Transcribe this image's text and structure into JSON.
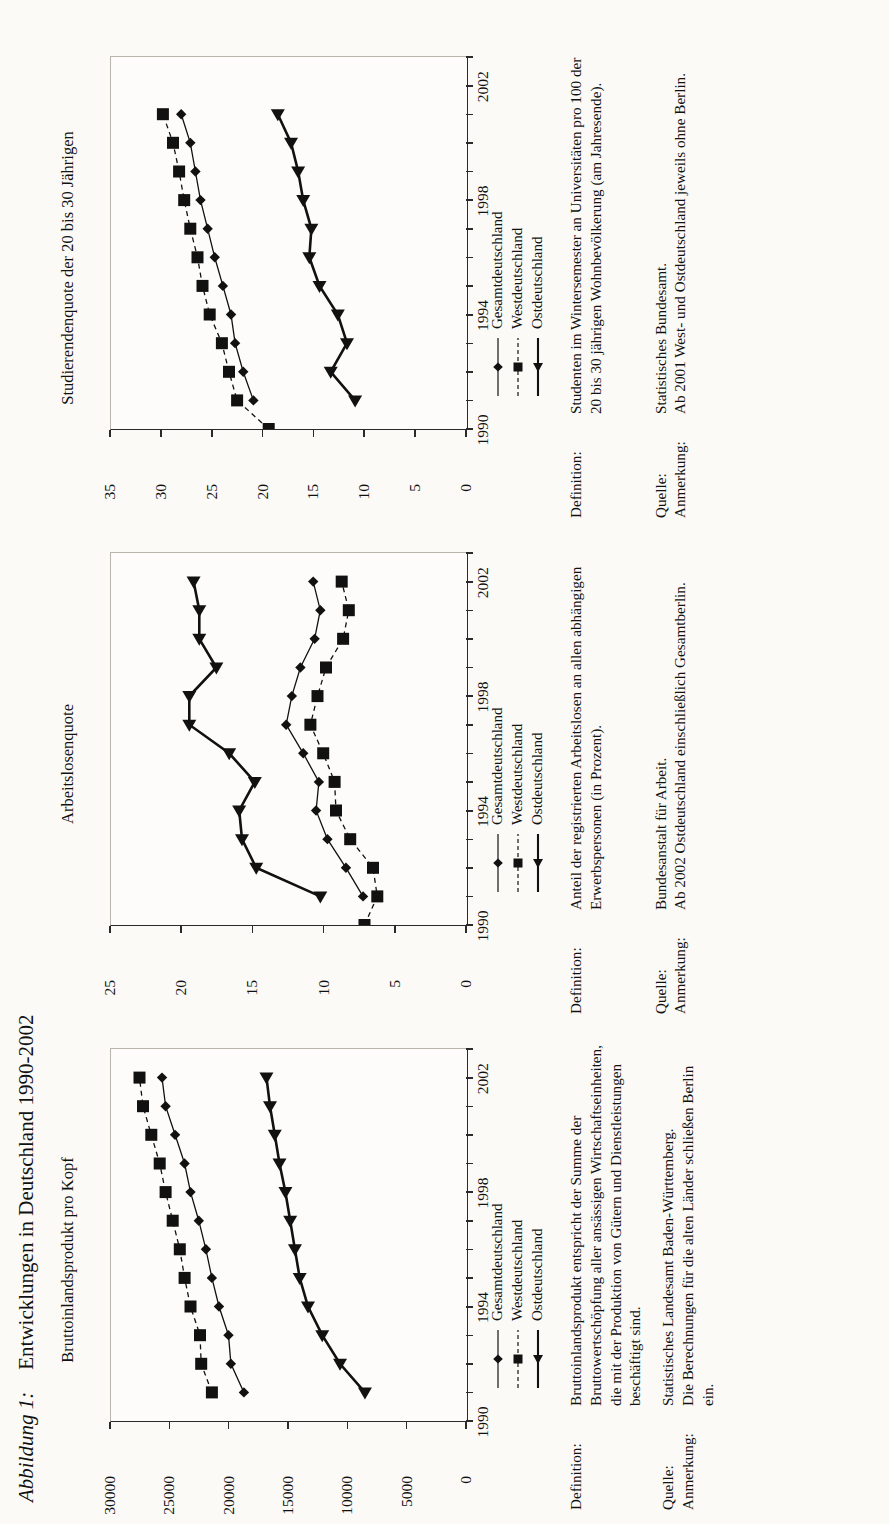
{
  "figure": {
    "label": "Abbildung 1:",
    "title": "Entwicklungen in Deutschland 1990-2002"
  },
  "series_names": {
    "gesamt": "Gesamtdeutschland",
    "west": "Westdeutschland",
    "ost": "Ostdeutschland"
  },
  "panels": [
    {
      "title": "Bruttoinlandsprodukt pro Kopf",
      "definition_label": "Definition:",
      "definition_text": "Bruttoinlandsprodukt entspricht der Summe der Bruttowertschöpfung aller ansässigen Wirtschaftseinheiten, die mit der Produktion von Gütern und Dienstleistungen beschäftigt sind.",
      "quelle_label": "Quelle:",
      "quelle_text": "Statistisches Landesamt Baden-Württemberg.",
      "anmerkung_label": "Anmerkung:",
      "anmerkung_text": "Die Berechnungen für die alten Länder schließen Berlin ein."
    },
    {
      "title": "Arbeitslosenquote",
      "definition_label": "Definition:",
      "definition_text": "Anteil der registrierten Arbeitslosen an allen abhängigen Erwerbspersonen (in Prozent).",
      "quelle_label": "Quelle:",
      "quelle_text": "Bundesanstalt für Arbeit.",
      "anmerkung_label": "Anmerkung:",
      "anmerkung_text": "Ab 2002 Ostdeutschland einschließlich Gesamtberlin."
    },
    {
      "title": "Studierendenquote der 20 bis 30 Jährigen",
      "definition_label": "Definition:",
      "definition_text": "Studenten im Wintersemester an Universitäten pro 100 der 20 bis 30 jährigen Wohnbevölkerung (am Jahresende).",
      "quelle_label": "Quelle:",
      "quelle_text": "Statistisches Bundesamt.",
      "anmerkung_label": "Anmerkung:",
      "anmerkung_text": "Ab 2001 West- und Ostdeutschland jeweils ohne Berlin."
    }
  ],
  "chart_data": [
    {
      "type": "line",
      "title": "Bruttoinlandsprodukt pro Kopf",
      "xlabel": "",
      "ylabel": "",
      "x": [
        1991,
        1992,
        1993,
        1994,
        1995,
        1996,
        1997,
        1998,
        1999,
        2000,
        2001,
        2002
      ],
      "xlim": [
        1990,
        2003
      ],
      "xticks": [
        1990,
        1994,
        1998,
        2002
      ],
      "ylim": [
        0,
        30000
      ],
      "yticks": [
        0,
        5000,
        10000,
        15000,
        20000,
        25000,
        30000
      ],
      "grid": false,
      "legend_position": "below-axis",
      "series": [
        {
          "name": "Gesamtdeutschland",
          "marker": "diamond",
          "line": "solid",
          "values": [
            18800,
            19900,
            20100,
            20900,
            21500,
            22000,
            22600,
            23300,
            23800,
            24600,
            25400,
            25700
          ]
        },
        {
          "name": "Westdeutschland",
          "marker": "square",
          "line": "dashed",
          "values": [
            21500,
            22400,
            22500,
            23300,
            23800,
            24200,
            24800,
            25400,
            25900,
            26600,
            27300,
            27600
          ]
        },
        {
          "name": "Ostdeutschland",
          "marker": "triangle",
          "line": "solid",
          "values": [
            8600,
            10700,
            12200,
            13400,
            14100,
            14500,
            14900,
            15300,
            15800,
            16200,
            16600,
            16900
          ]
        }
      ]
    },
    {
      "type": "line",
      "title": "Arbeitslosenquote",
      "xlabel": "",
      "ylabel": "",
      "x": [
        1990,
        1991,
        1992,
        1993,
        1994,
        1995,
        1996,
        1997,
        1998,
        1999,
        2000,
        2001,
        2002
      ],
      "xlim": [
        1990,
        2003
      ],
      "xticks": [
        1990,
        1994,
        1998,
        2002
      ],
      "ylim": [
        0,
        25
      ],
      "yticks": [
        0,
        5,
        10,
        15,
        20,
        25
      ],
      "grid": false,
      "legend_position": "below-axis",
      "series": [
        {
          "name": "Gesamtdeutschland",
          "marker": "diamond",
          "line": "solid",
          "values": [
            null,
            7.3,
            8.5,
            9.8,
            10.6,
            10.4,
            11.5,
            12.7,
            12.3,
            11.7,
            10.7,
            10.3,
            10.8
          ]
        },
        {
          "name": "Westdeutschland",
          "marker": "square",
          "line": "dashed",
          "values": [
            7.2,
            6.3,
            6.6,
            8.2,
            9.2,
            9.3,
            10.1,
            11.0,
            10.5,
            9.9,
            8.7,
            8.3,
            8.8
          ]
        },
        {
          "name": "Ostdeutschland",
          "marker": "triangle",
          "line": "solid",
          "values": [
            null,
            10.3,
            14.8,
            15.8,
            16.0,
            14.9,
            16.7,
            19.5,
            19.5,
            17.6,
            18.8,
            18.8,
            19.2
          ]
        }
      ]
    },
    {
      "type": "line",
      "title": "Studierendenquote der 20 bis 30 Jährigen",
      "xlabel": "",
      "ylabel": "",
      "x": [
        1990,
        1991,
        1992,
        1993,
        1994,
        1995,
        1996,
        1997,
        1998,
        1999,
        2000,
        2001
      ],
      "xlim": [
        1990,
        2003
      ],
      "xticks": [
        1990,
        1994,
        1998,
        2002
      ],
      "ylim": [
        0,
        35
      ],
      "yticks": [
        0,
        5,
        10,
        15,
        20,
        25,
        30,
        35
      ],
      "grid": false,
      "legend_position": "below-axis",
      "series": [
        {
          "name": "Gesamtdeutschland",
          "marker": "diamond",
          "line": "solid",
          "values": [
            null,
            21.0,
            22.0,
            22.8,
            23.2,
            24.0,
            24.8,
            25.5,
            26.2,
            26.7,
            27.2,
            28.1
          ]
        },
        {
          "name": "Westdeutschland",
          "marker": "square",
          "line": "dashed",
          "values": [
            19.5,
            22.6,
            23.4,
            24.1,
            25.3,
            26.0,
            26.5,
            27.2,
            27.8,
            28.3,
            28.9,
            29.9
          ]
        },
        {
          "name": "Ostdeutschland",
          "marker": "triangle",
          "line": "solid",
          "values": [
            null,
            11.0,
            13.4,
            11.8,
            12.7,
            14.5,
            15.5,
            15.3,
            16.1,
            16.6,
            17.3,
            18.6
          ]
        }
      ]
    }
  ]
}
